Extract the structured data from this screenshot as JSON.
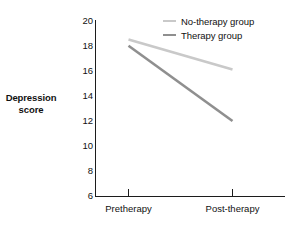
{
  "chart_data": {
    "type": "line",
    "title": "",
    "subtitle": "",
    "xlabel": "",
    "ylabel": "Depression score",
    "ylabel_lines": [
      "Depression",
      "score"
    ],
    "categories": [
      "Pretherapy",
      "Post-therapy"
    ],
    "ylim": [
      6,
      20
    ],
    "yticks": [
      20,
      18,
      16,
      14,
      12,
      10,
      8,
      6
    ],
    "xticks": [
      "Pretherapy",
      "Post-therapy"
    ],
    "grid": false,
    "legend_position": "top-right",
    "series": [
      {
        "name": "No-therapy group",
        "values": [
          18.5,
          16.1
        ],
        "color": "#c9c9c9"
      },
      {
        "name": "Therapy group",
        "values": [
          18.0,
          12.0
        ],
        "color": "#8f8f8f"
      }
    ]
  },
  "axis": {
    "color": "#1c1c1c"
  }
}
